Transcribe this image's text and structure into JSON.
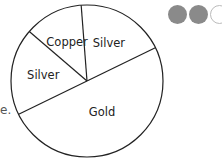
{
  "text_fragment": "e.",
  "progress_dots": [
    {
      "state": "filled",
      "color": "#8a8a8a"
    },
    {
      "state": "filled",
      "color": "#8a8a8a"
    },
    {
      "state": "empty",
      "color": "#ffffff"
    }
  ],
  "chart_data": {
    "type": "pie",
    "title": "",
    "start_angle_deg": 26,
    "direction": "counterclockwise",
    "slices": [
      {
        "label": "Silver",
        "percent": 19
      },
      {
        "label": "Copper",
        "percent": 12.5
      },
      {
        "label": "Silver",
        "percent": 18.5
      },
      {
        "label": "Gold",
        "percent": 50
      }
    ],
    "fill": "#ffffff",
    "stroke": "#222222",
    "legend": "none"
  }
}
